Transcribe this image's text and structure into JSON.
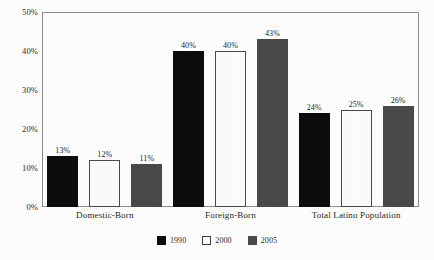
{
  "chart_data": {
    "type": "bar",
    "title": "",
    "subtitle": "",
    "xlabel": "",
    "ylabel": "",
    "categories": [
      "Domestic-Born",
      "Foreign-Born",
      "Total Latino Population"
    ],
    "series": [
      {
        "name": "1990",
        "values": [
          13,
          40,
          24
        ],
        "labels": [
          "13%",
          "40%",
          "24%"
        ],
        "color": "#0d0d0d"
      },
      {
        "name": "2000",
        "values": [
          12,
          40,
          25
        ],
        "labels": [
          "12%",
          "40%",
          "25%"
        ],
        "color": "#ffffff"
      },
      {
        "name": "2005",
        "values": [
          11,
          43,
          26
        ],
        "labels": [
          "11%",
          "43%",
          "26%"
        ],
        "color": "#4a4a4a"
      }
    ],
    "ylim": [
      0,
      50
    ],
    "y_ticks": [
      0,
      10,
      20,
      30,
      40,
      50
    ],
    "y_tick_labels": [
      "0%",
      "10%",
      "20%",
      "30%",
      "40%",
      "50%"
    ],
    "grid": false,
    "legend_position": "bottom",
    "legend_entries": [
      "1990",
      "2000",
      "2005"
    ],
    "value_labels_shown": true,
    "axis_color": "#8d8d8d"
  }
}
